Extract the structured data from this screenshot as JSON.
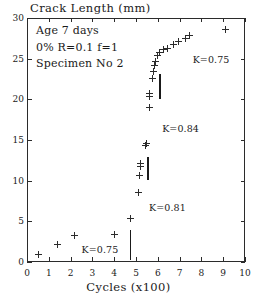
{
  "chart_data": {
    "type": "scatter",
    "title": "Crack Length (mm)",
    "xlabel": "Cycles (x100)",
    "ylabel": "Crack Length (mm)",
    "xlim": [
      0,
      10
    ],
    "ylim": [
      0,
      30
    ],
    "xticks": [
      0,
      1,
      2,
      3,
      4,
      5,
      6,
      7,
      8,
      9,
      10
    ],
    "yticks": [
      0,
      5,
      10,
      15,
      20,
      25,
      30
    ],
    "xticklabels": [
      "0",
      "1",
      "2",
      "3",
      "4",
      "5",
      "6",
      "7",
      "8",
      "9",
      "10"
    ],
    "yticklabels": [
      "0",
      "5",
      "10",
      "15",
      "20",
      "25",
      "30"
    ],
    "grid": false,
    "legend": null,
    "marker": "plus",
    "series": [
      {
        "name": "Specimen No 2",
        "x": [
          0.55,
          1.4,
          2.2,
          4.0,
          4.75,
          5.1,
          5.15,
          5.2,
          5.2,
          5.45,
          5.5,
          5.6,
          5.6,
          5.6,
          5.75,
          5.8,
          5.85,
          5.9,
          6.0,
          6.1,
          6.25,
          6.45,
          6.7,
          6.95,
          7.25,
          7.45,
          9.1
        ],
        "y": [
          0.9,
          2.2,
          3.3,
          3.4,
          5.3,
          8.5,
          10.6,
          11.7,
          12.1,
          14.3,
          14.6,
          19.0,
          20.3,
          20.7,
          22.6,
          23.4,
          24.1,
          24.7,
          25.4,
          25.7,
          26.1,
          26.3,
          26.7,
          27.1,
          27.5,
          27.8,
          28.6
        ]
      }
    ],
    "annotations": [
      {
        "text": "Age 7 days"
      },
      {
        "text": "0% R=0.1 f=1"
      },
      {
        "text": "Specimen No 2"
      }
    ],
    "k_labels": [
      {
        "text": "K=0.75",
        "x": 2.5,
        "y": 1.5
      },
      {
        "text": "K=0.81",
        "x": 5.6,
        "y": 6.6
      },
      {
        "text": "K=0.84",
        "x": 6.2,
        "y": 16.3
      },
      {
        "text": "K=0.75",
        "x": 7.6,
        "y": 24.8
      }
    ],
    "vertical_bars": [
      {
        "x": 4.75,
        "y_bottom": 0.2,
        "y_top": 3.9
      },
      {
        "x": 5.55,
        "y_bottom": 10.1,
        "y_top": 12.9
      },
      {
        "x": 6.1,
        "y_bottom": 20.1,
        "y_top": 23.1
      }
    ],
    "colors": {
      "axis": "#2b2b2b",
      "marker": "#2b2b2b",
      "text": "#1a1a1a",
      "background": "#ffffff"
    }
  }
}
